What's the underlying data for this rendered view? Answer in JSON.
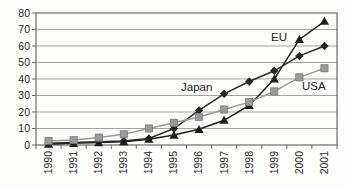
{
  "chart_data": {
    "type": "line",
    "title": "",
    "xlabel": "",
    "ylabel": "",
    "categories": [
      "1990",
      "1991",
      "1992",
      "1993",
      "1994",
      "1995",
      "1996",
      "1997",
      "1998",
      "1999",
      "2000",
      "2001"
    ],
    "series": [
      {
        "name": "Japan",
        "marker": "diamond",
        "line_color": "#2e2e2e",
        "marker_color": "#262626",
        "values": [
          1,
          1.5,
          2,
          2.5,
          4,
          10,
          21,
          31,
          38.5,
          45,
          54,
          60
        ]
      },
      {
        "name": "EU",
        "marker": "triangle",
        "line_color": "#222222",
        "marker_color": "#1f1f1f",
        "values": [
          0.5,
          1,
          1.5,
          2,
          3.5,
          6,
          9.5,
          15,
          24,
          40,
          64,
          75
        ]
      },
      {
        "name": "USA",
        "marker": "square",
        "line_color": "#9a9a9a",
        "marker_color": "#999999",
        "values": [
          2.5,
          3,
          4.5,
          6.5,
          10,
          13.5,
          17,
          21.5,
          26,
          32.5,
          41,
          46.5
        ]
      }
    ],
    "ylim": [
      0,
      80
    ],
    "ytick": 10,
    "grid": true,
    "legend_position": "inline-annotations",
    "annotations": [
      {
        "text": "Japan",
        "series": "Japan"
      },
      {
        "text": "EU",
        "series": "EU"
      },
      {
        "text": "USA",
        "series": "USA"
      }
    ],
    "colors": {
      "axis": "#6b6b6b",
      "grid": "#a3a3a3",
      "text": "#2a2a2a",
      "plot_background": "#fdfdfb"
    }
  }
}
